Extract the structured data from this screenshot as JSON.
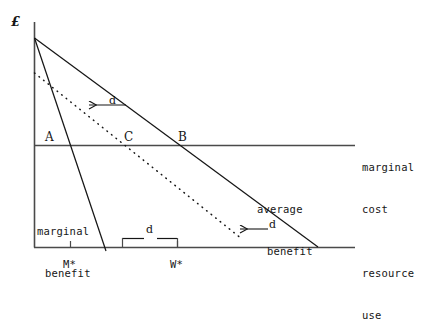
{
  "figure": {
    "type": "economics-line-diagram",
    "background": "#ffffff",
    "ink_color": "#161616"
  },
  "axes": {
    "y_axis_label": "£",
    "x_axis_label_line1": "resource",
    "x_axis_label_line2": "use",
    "origin_px": [
      34,
      247
    ],
    "y_top_px": 22,
    "x_right_px": 355
  },
  "curves": {
    "marginal_cost": {
      "label_line1": "marginal",
      "label_line2": "cost",
      "style": "solid-horizontal",
      "y_px": 145
    },
    "average_benefit": {
      "label_line1": "average",
      "label_line2": "benefit",
      "style": "solid",
      "from_px": [
        34,
        38
      ],
      "to_px": [
        318,
        247
      ]
    },
    "marginal_benefit": {
      "label_line1": "marginal",
      "label_line2": "benefit",
      "style": "solid",
      "from_px": [
        34,
        38
      ],
      "to_px": [
        106,
        251
      ]
    },
    "shifted_benefit": {
      "label": "",
      "style": "dotted",
      "from_px": [
        34,
        73
      ],
      "to_px": [
        242,
        239
      ]
    }
  },
  "points": [
    {
      "label": "A",
      "x_px": 50,
      "y_px": 133
    },
    {
      "label": "C",
      "x_px": 128,
      "y_px": 133
    },
    {
      "label": "B",
      "x_px": 182,
      "y_px": 133
    }
  ],
  "ticks": [
    {
      "label": "M*",
      "x_px": 70
    },
    {
      "label": "W*",
      "x_px": 177
    }
  ],
  "annotations": {
    "shift_arrow_upper": {
      "label": "d",
      "from_px": [
        126,
        105
      ],
      "to_px": [
        88,
        105
      ]
    },
    "shift_arrow_lower": {
      "label": "d",
      "from_px": [
        268,
        229
      ],
      "to_px": [
        239,
        229
      ]
    },
    "gap_bracket": {
      "label": "d",
      "left_px": 122,
      "right_px": 177,
      "y_px": 238
    }
  }
}
